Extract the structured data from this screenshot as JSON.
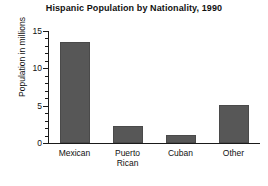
{
  "chart_data": {
    "type": "bar",
    "title": "Hispanic Population by Nationality, 1990",
    "xlabel": "",
    "ylabel": "Population in millions",
    "categories": [
      "Mexican",
      "Puerto Rican",
      "Cuban",
      "Other"
    ],
    "category_lines": [
      [
        "Mexican"
      ],
      [
        "Puerto",
        "Rican"
      ],
      [
        "Cuban"
      ],
      [
        "Other"
      ]
    ],
    "values": [
      13.5,
      2.3,
      1.1,
      5.1
    ],
    "ylim": [
      0,
      15
    ],
    "ytick_labels": [
      "0",
      "5",
      "10",
      "15"
    ],
    "ytick_values": [
      0,
      5,
      10,
      15
    ],
    "minor_tick_step": 1,
    "grid": false,
    "legend": false,
    "bar_color": "#575757",
    "axis_color": "#1a1a1a",
    "background": "#ffffff"
  }
}
